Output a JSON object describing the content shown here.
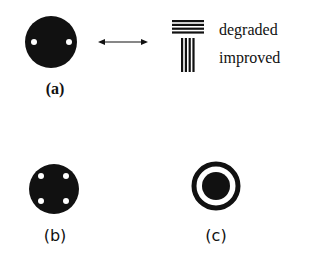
{
  "figure": {
    "panels": [
      {
        "id": "a",
        "label": "(a)",
        "shape": "disc-with-2-holes"
      },
      {
        "id": "b",
        "label": "(b)",
        "shape": "disc-with-4-holes"
      },
      {
        "id": "c",
        "label": "(c)",
        "shape": "ring-with-center-disc"
      }
    ],
    "arrow": {
      "type": "double-headed-arrow"
    },
    "legend": {
      "items": [
        {
          "icon": "horizontal-lines-icon",
          "label": "degraded"
        },
        {
          "icon": "vertical-lines-icon",
          "label": "improved"
        }
      ]
    },
    "colors": {
      "ink": "#111111",
      "background": "#ffffff"
    }
  }
}
